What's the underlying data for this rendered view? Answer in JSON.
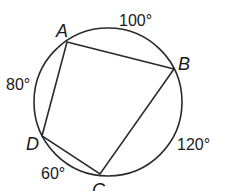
{
  "figure": {
    "type": "inscribed-quadrilateral",
    "shape": "circle",
    "vertices": [
      "A",
      "B",
      "C",
      "D"
    ],
    "arcs": [
      {
        "from": "A",
        "to": "B",
        "measure": "100°"
      },
      {
        "from": "B",
        "to": "C",
        "measure": "120°"
      },
      {
        "from": "C",
        "to": "D",
        "measure": "60°"
      },
      {
        "from": "D",
        "to": "A",
        "measure": "80°"
      }
    ],
    "colors": {
      "stroke": "#2a2a2a",
      "text": "#1a1a1a",
      "background": "#ffffff"
    }
  }
}
